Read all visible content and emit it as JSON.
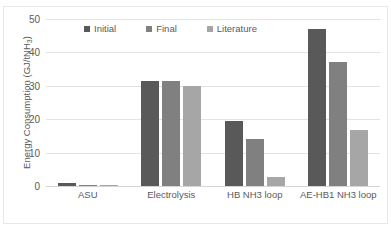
{
  "chart_data": {
    "type": "bar",
    "title": "",
    "xlabel": "",
    "ylabel": "Energy Consumption (GJ/tNH3)",
    "ylabel_main": "Energy Consumption (GJ/tNH",
    "ylabel_sub": "3",
    "ylabel_tail": ")",
    "categories": [
      "ASU",
      "Electrolysis",
      "HB NH3 loop",
      "AE-HB1 NH3 loop"
    ],
    "series": [
      {
        "name": "Initial",
        "color": "#595959",
        "values": [
          0.9,
          31.3,
          19.5,
          47.0
        ]
      },
      {
        "name": "Final",
        "color": "#808080",
        "values": [
          0.25,
          31.3,
          14.0,
          37.2
        ]
      },
      {
        "name": "Literature",
        "color": "#a6a6a6",
        "values": [
          0.25,
          30.0,
          2.8,
          16.8
        ]
      }
    ],
    "ylim": [
      0,
      50
    ],
    "yticks": [
      50,
      40,
      30,
      20,
      10,
      0
    ],
    "ytick_labels": [
      "50",
      "40",
      "30",
      "20",
      "10",
      "0"
    ],
    "grid": true,
    "legend_position": "top-center",
    "gridline_color": "#e3e3e6",
    "axis_text_color": "#5a5a5a",
    "background": "#ffffff"
  },
  "figure": {
    "clipped_title_ghost": "",
    "frame_color": "#e8e8ea"
  }
}
